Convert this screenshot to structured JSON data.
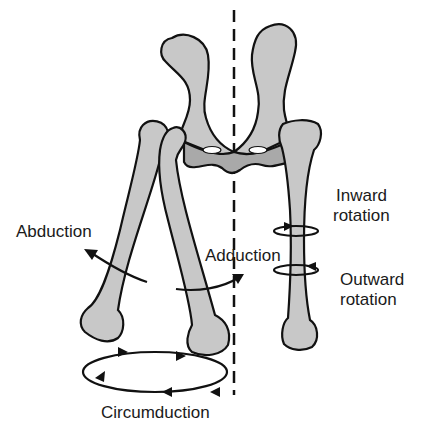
{
  "diagram": {
    "labels": {
      "abduction": "Abduction",
      "adduction": "Adduction",
      "inward_rotation_1": "Inward",
      "inward_rotation_2": "rotation",
      "outward_rotation_1": "Outward",
      "outward_rotation_2": "rotation",
      "circumduction": "Circumduction"
    },
    "colors": {
      "bone": "#c8c8c8",
      "bone_dark": "#a9a9a9",
      "outline": "#111111",
      "background": "#ffffff"
    }
  }
}
